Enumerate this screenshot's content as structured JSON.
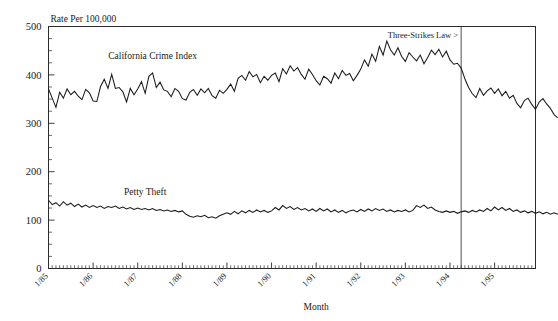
{
  "chart_data": {
    "type": "line",
    "title": "",
    "ylabel": "Rate Per 100,000",
    "xlabel": "Month",
    "ylim": [
      0,
      500
    ],
    "ytick_labels": [
      "0",
      "100",
      "200",
      "300",
      "400",
      "500"
    ],
    "ytick_values": [
      0,
      100,
      200,
      300,
      400,
      500
    ],
    "yminor_step": 25,
    "grid": false,
    "legend_position": "inline-labels",
    "xtick_labels": [
      "1/85",
      "1/86",
      "1/87",
      "1/88",
      "1/89",
      "1/90",
      "1/91",
      "1/92",
      "1/93",
      "1/94",
      "1/95"
    ],
    "xtick_values": [
      0,
      12,
      24,
      36,
      48,
      60,
      72,
      84,
      96,
      108,
      120
    ],
    "x_minor_step_months": 1,
    "x_range_months": [
      0,
      131
    ],
    "annotations": [
      {
        "text": "Three-Strikes Law >",
        "x_month": 111,
        "note": "vertical reference line at March 1994"
      }
    ],
    "series": [
      {
        "name": "California Crime Index",
        "label_x_month": 28,
        "label_y": 432,
        "values": [
          371,
          352,
          333,
          364,
          352,
          371,
          359,
          366,
          356,
          349,
          370,
          363,
          346,
          345,
          376,
          391,
          372,
          401,
          372,
          374,
          365,
          344,
          372,
          359,
          371,
          386,
          362,
          397,
          404,
          374,
          385,
          369,
          366,
          355,
          372,
          366,
          351,
          348,
          364,
          370,
          358,
          371,
          363,
          372,
          357,
          352,
          368,
          362,
          370,
          381,
          366,
          393,
          399,
          389,
          407,
          396,
          401,
          384,
          397,
          389,
          399,
          404,
          386,
          413,
          402,
          419,
          408,
          415,
          401,
          391,
          412,
          401,
          388,
          379,
          397,
          392,
          383,
          404,
          392,
          409,
          399,
          403,
          388,
          399,
          412,
          431,
          418,
          443,
          428,
          459,
          441,
          470,
          452,
          441,
          456,
          438,
          428,
          446,
          437,
          429,
          441,
          423,
          436,
          451,
          442,
          453,
          437,
          449,
          431,
          422,
          424,
          414,
          392,
          374,
          361,
          353,
          372,
          358,
          367,
          373,
          362,
          371,
          357,
          366,
          352,
          358,
          341,
          332,
          347,
          352,
          339,
          329,
          344,
          351,
          340,
          331,
          318,
          311
        ]
      },
      {
        "name": "Petty Theft",
        "label_x_month": 26,
        "label_y": 152,
        "values": [
          141,
          132,
          136,
          129,
          138,
          131,
          135,
          128,
          133,
          127,
          131,
          126,
          130,
          126,
          129,
          124,
          128,
          126,
          129,
          124,
          127,
          123,
          126,
          122,
          125,
          122,
          124,
          121,
          124,
          120,
          122,
          119,
          121,
          118,
          120,
          117,
          119,
          112,
          108,
          106,
          109,
          107,
          110,
          105,
          107,
          104,
          109,
          112,
          115,
          112,
          118,
          113,
          119,
          115,
          120,
          116,
          121,
          117,
          120,
          116,
          119,
          126,
          121,
          130,
          124,
          128,
          122,
          126,
          121,
          124,
          119,
          123,
          118,
          124,
          119,
          123,
          117,
          121,
          116,
          120,
          115,
          119,
          121,
          117,
          122,
          118,
          123,
          119,
          124,
          120,
          123,
          118,
          121,
          117,
          120,
          118,
          121,
          117,
          120,
          130,
          126,
          131,
          124,
          127,
          121,
          118,
          116,
          119,
          116,
          118,
          114,
          117,
          119,
          116,
          120,
          117,
          121,
          118,
          124,
          119,
          127,
          121,
          126,
          120,
          124,
          118,
          121,
          116,
          119,
          115,
          118,
          114,
          117,
          113,
          116,
          112,
          115,
          112
        ]
      }
    ]
  }
}
